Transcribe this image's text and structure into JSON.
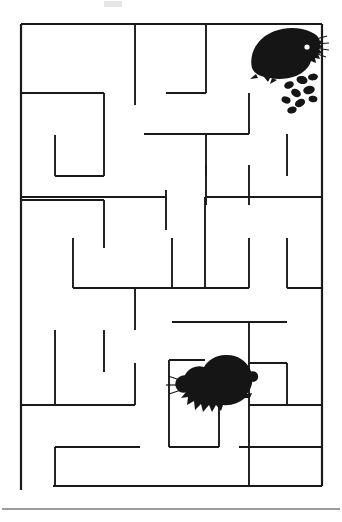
{
  "page": {
    "kind": "maze-puzzle-worksheet",
    "background_color": "#ffffff",
    "wall_color": "#1a1a1a",
    "width": 342,
    "height": 522
  },
  "maze": {
    "name": "hedgehog-maze",
    "origin_x": 21,
    "origin_y": 24,
    "cell": 30,
    "cols": 10,
    "rows": 15.4,
    "wall_thickness": 1.9,
    "border_thickness": 2.2,
    "left": 21,
    "top": 24,
    "right": 322,
    "bottom": 486,
    "border_segments": [
      {
        "name": "top-border",
        "x1": 21,
        "y1": 24,
        "x2": 322,
        "y2": 24
      },
      {
        "name": "right-border",
        "x1": 322,
        "y1": 24,
        "x2": 322,
        "y2": 486
      },
      {
        "name": "bottom-border",
        "x1": 53,
        "y1": 486,
        "x2": 322,
        "y2": 486
      },
      {
        "name": "left-border-upper",
        "x1": 21,
        "y1": 24,
        "x2": 21,
        "y2": 490
      }
    ],
    "interior_walls": [
      {
        "x1": 21,
        "y1": 93,
        "x2": 104,
        "y2": 93
      },
      {
        "x1": 104,
        "y1": 93,
        "x2": 104,
        "y2": 176
      },
      {
        "x1": 55,
        "y1": 135,
        "x2": 55,
        "y2": 176
      },
      {
        "x1": 55,
        "y1": 176,
        "x2": 104,
        "y2": 176
      },
      {
        "x1": 135,
        "y1": 24,
        "x2": 135,
        "y2": 105
      },
      {
        "x1": 166,
        "y1": 93,
        "x2": 206,
        "y2": 93
      },
      {
        "x1": 206,
        "y1": 24,
        "x2": 206,
        "y2": 93
      },
      {
        "x1": 144,
        "y1": 134,
        "x2": 249,
        "y2": 134
      },
      {
        "x1": 249,
        "y1": 93,
        "x2": 249,
        "y2": 134
      },
      {
        "x1": 287,
        "y1": 134,
        "x2": 287,
        "y2": 176
      },
      {
        "x1": 206,
        "y1": 134,
        "x2": 206,
        "y2": 176
      },
      {
        "x1": 206,
        "y1": 165,
        "x2": 206,
        "y2": 205
      },
      {
        "x1": 249,
        "y1": 165,
        "x2": 249,
        "y2": 205
      },
      {
        "x1": 166,
        "y1": 190,
        "x2": 166,
        "y2": 230
      },
      {
        "x1": 21,
        "y1": 197,
        "x2": 166,
        "y2": 197
      },
      {
        "x1": 166,
        "y1": 197,
        "x2": 166,
        "y2": 200
      },
      {
        "x1": 205,
        "y1": 197,
        "x2": 322,
        "y2": 197
      },
      {
        "x1": 205,
        "y1": 197,
        "x2": 205,
        "y2": 288
      },
      {
        "x1": 21,
        "y1": 200,
        "x2": 104,
        "y2": 200
      },
      {
        "x1": 104,
        "y1": 200,
        "x2": 104,
        "y2": 248
      },
      {
        "x1": 73,
        "y1": 238,
        "x2": 73,
        "y2": 288
      },
      {
        "x1": 73,
        "y1": 288,
        "x2": 205,
        "y2": 288
      },
      {
        "x1": 172,
        "y1": 238,
        "x2": 172,
        "y2": 288
      },
      {
        "x1": 249,
        "y1": 238,
        "x2": 249,
        "y2": 288
      },
      {
        "x1": 205,
        "y1": 288,
        "x2": 249,
        "y2": 288
      },
      {
        "x1": 287,
        "y1": 238,
        "x2": 287,
        "y2": 288
      },
      {
        "x1": 287,
        "y1": 288,
        "x2": 322,
        "y2": 288
      },
      {
        "x1": 135,
        "y1": 288,
        "x2": 135,
        "y2": 330
      },
      {
        "x1": 172,
        "y1": 322,
        "x2": 287,
        "y2": 322
      },
      {
        "x1": 249,
        "y1": 322,
        "x2": 249,
        "y2": 364
      },
      {
        "x1": 55,
        "y1": 330,
        "x2": 55,
        "y2": 405
      },
      {
        "x1": 104,
        "y1": 330,
        "x2": 104,
        "y2": 372
      },
      {
        "x1": 135,
        "y1": 363,
        "x2": 135,
        "y2": 405
      },
      {
        "x1": 21,
        "y1": 405,
        "x2": 135,
        "y2": 405
      },
      {
        "x1": 169,
        "y1": 360,
        "x2": 205,
        "y2": 360
      },
      {
        "x1": 169,
        "y1": 360,
        "x2": 169,
        "y2": 447
      },
      {
        "x1": 219,
        "y1": 385,
        "x2": 219,
        "y2": 447
      },
      {
        "x1": 169,
        "y1": 447,
        "x2": 219,
        "y2": 447
      },
      {
        "x1": 249,
        "y1": 363,
        "x2": 287,
        "y2": 363
      },
      {
        "x1": 287,
        "y1": 363,
        "x2": 287,
        "y2": 405
      },
      {
        "x1": 249,
        "y1": 405,
        "x2": 322,
        "y2": 405
      },
      {
        "x1": 249,
        "y1": 363,
        "x2": 249,
        "y2": 447
      },
      {
        "x1": 55,
        "y1": 447,
        "x2": 140,
        "y2": 447
      },
      {
        "x1": 55,
        "y1": 447,
        "x2": 55,
        "y2": 486
      },
      {
        "x1": 239,
        "y1": 447,
        "x2": 322,
        "y2": 447
      },
      {
        "x1": 249,
        "y1": 447,
        "x2": 249,
        "y2": 486
      }
    ]
  },
  "animals": [
    {
      "name": "hedgehog-top-right",
      "label": "hedgehog",
      "x": 248,
      "y": 28,
      "width": 72,
      "height": 58,
      "color": "#151515"
    },
    {
      "name": "hedgehog-center",
      "label": "hedgehog",
      "x": 170,
      "y": 363,
      "width": 68,
      "height": 58,
      "color": "#151515"
    }
  ],
  "pellets": {
    "name": "food-pellets",
    "label": "food pellets",
    "count": 9,
    "color": "#151515",
    "items": [
      {
        "cx": 289,
        "cy": 85,
        "rx": 5.0,
        "ry": 3.6,
        "rot": -22
      },
      {
        "cx": 302,
        "cy": 80,
        "rx": 5.6,
        "ry": 4.0,
        "rot": 14
      },
      {
        "cx": 313,
        "cy": 77,
        "rx": 5.0,
        "ry": 3.4,
        "rot": -8
      },
      {
        "cx": 296,
        "cy": 93,
        "rx": 5.2,
        "ry": 3.8,
        "rot": 30
      },
      {
        "cx": 309,
        "cy": 90,
        "rx": 5.8,
        "ry": 4.2,
        "rot": -12
      },
      {
        "cx": 286,
        "cy": 100,
        "rx": 4.6,
        "ry": 3.4,
        "rot": 18
      },
      {
        "cx": 300,
        "cy": 103,
        "rx": 5.4,
        "ry": 3.8,
        "rot": -28
      },
      {
        "cx": 313,
        "cy": 99,
        "rx": 4.4,
        "ry": 3.2,
        "rot": 8
      },
      {
        "cx": 292,
        "cy": 110,
        "rx": 4.8,
        "ry": 3.4,
        "rot": -16
      }
    ]
  },
  "artifact": {
    "name": "top-smudge-artifact",
    "x": 104,
    "y": 0,
    "width": 18,
    "height": 8,
    "color": "#cfcfcf"
  },
  "footer_rule": {
    "name": "footer-horizontal-rule",
    "x1": 2,
    "y1": 509,
    "x2": 340,
    "y2": 509,
    "color": "#3a3a3a"
  }
}
